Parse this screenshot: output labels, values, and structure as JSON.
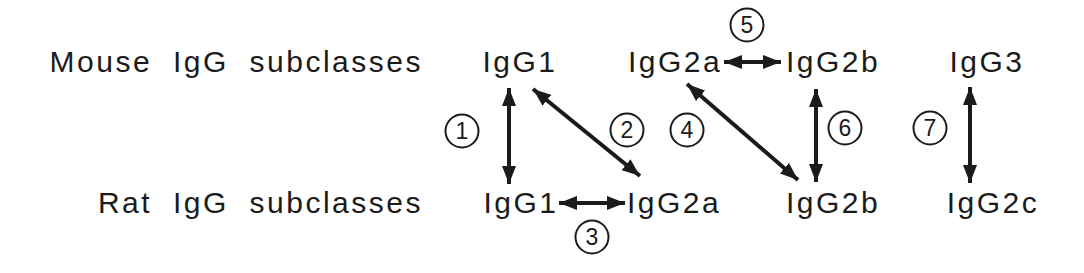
{
  "figure": {
    "type": "correspondence-diagram",
    "background": "#ffffff",
    "ink": "#1b1b1b",
    "rows": [
      {
        "name": "mouse",
        "label": "Mouse IgG subclasses",
        "items": [
          {
            "label": "IgG1"
          },
          {
            "label": "IgG2a"
          },
          {
            "label": "IgG2b"
          },
          {
            "label": "IgG3"
          }
        ]
      },
      {
        "name": "rat",
        "label": "Rat IgG subclasses",
        "items": [
          {
            "label": "IgG1"
          },
          {
            "label": "IgG2a"
          },
          {
            "label": "IgG2b"
          },
          {
            "label": "IgG2c"
          }
        ]
      }
    ],
    "connections": [
      {
        "number": "1",
        "from": "mouse IgG1",
        "to": "rat IgG1",
        "style": "double-headed-arrow",
        "orientation": "vertical"
      },
      {
        "number": "2",
        "from": "mouse IgG1",
        "to": "rat IgG2a",
        "style": "double-headed-arrow",
        "orientation": "diagonal"
      },
      {
        "number": "3",
        "from": "rat IgG1",
        "to": "rat IgG2a",
        "style": "double-headed-arrow",
        "orientation": "horizontal"
      },
      {
        "number": "4",
        "from": "mouse IgG2a",
        "to": "rat IgG2b",
        "style": "double-headed-arrow",
        "orientation": "diagonal"
      },
      {
        "number": "5",
        "from": "mouse IgG2a",
        "to": "mouse IgG2b",
        "style": "double-headed-arrow",
        "orientation": "horizontal"
      },
      {
        "number": "6",
        "from": "mouse IgG2b",
        "to": "rat IgG2b",
        "style": "double-headed-arrow",
        "orientation": "vertical"
      },
      {
        "number": "7",
        "from": "mouse IgG3",
        "to": "rat IgG2c",
        "style": "double-headed-arrow",
        "orientation": "vertical"
      }
    ]
  }
}
